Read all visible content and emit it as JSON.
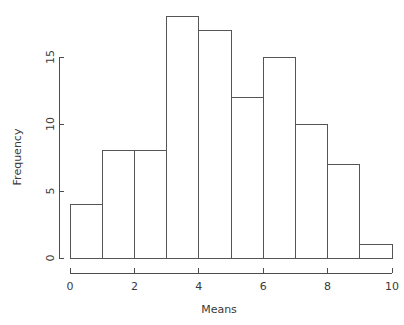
{
  "figure": {
    "kind": "histogram-figure",
    "background_color": "#ffffff",
    "line_color": "#555555",
    "axis_color": "#4d4d4d",
    "text_color": "#3a3a3a"
  },
  "chart_data": {
    "type": "bar",
    "subtype": "histogram",
    "title": "",
    "xlabel": "Means",
    "ylabel": "Frequency",
    "grid": false,
    "legend": false,
    "legend_position": "none",
    "bin_width": 1,
    "bin_edges": [
      0,
      1,
      2,
      3,
      4,
      5,
      6,
      7,
      8,
      9,
      10
    ],
    "categories": [
      "0-1",
      "1-2",
      "2-3",
      "3-4",
      "4-5",
      "5-6",
      "6-7",
      "7-8",
      "8-9",
      "9-10"
    ],
    "x": [
      0.5,
      1.5,
      2.5,
      3.5,
      4.5,
      5.5,
      6.5,
      7.5,
      8.5,
      9.5
    ],
    "values": [
      4,
      8,
      8,
      18,
      17,
      12,
      15,
      10,
      7,
      1
    ],
    "xlim": [
      0,
      10
    ],
    "ylim": [
      0,
      18
    ],
    "xticks": [
      0,
      2,
      4,
      6,
      8,
      10
    ],
    "xticklabels": [
      "0",
      "2",
      "4",
      "6",
      "8",
      "10"
    ],
    "yticks": [
      0,
      5,
      10,
      15
    ],
    "yticklabels": [
      "0",
      "5",
      "10",
      "15"
    ],
    "bar_fill": "none",
    "bar_edge_color": "#555555"
  }
}
